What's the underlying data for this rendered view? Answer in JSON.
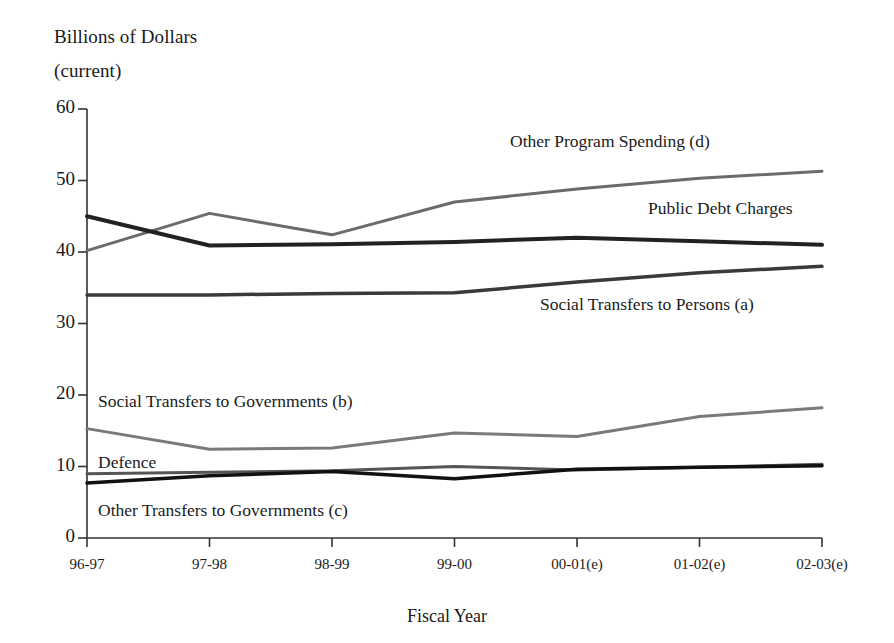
{
  "axis_title": {
    "line1": "Billions of Dollars",
    "line2": "(current)"
  },
  "xaxis_title": "Fiscal Year",
  "chart_data": {
    "type": "line",
    "title": "Billions of Dollars (current)",
    "xlabel": "Fiscal Year",
    "ylabel": "Billions of Dollars (current)",
    "categories": [
      "96-97",
      "97-98",
      "98-99",
      "99-00",
      "00-01(e)",
      "01-02(e)",
      "02-03(e)"
    ],
    "ylim": [
      0,
      60
    ],
    "yticks": [
      0,
      10,
      20,
      30,
      40,
      50,
      60
    ],
    "grid": false,
    "legend": "inline-labels",
    "series": [
      {
        "name": "Other Program Spending (d)",
        "color": "#6b6b6b",
        "width": 3,
        "values": [
          40.2,
          45.4,
          42.4,
          47.0,
          48.8,
          50.3,
          51.3
        ],
        "label_x": 510,
        "label_y": 131
      },
      {
        "name": "Public Debt Charges",
        "color": "#222222",
        "width": 4,
        "values": [
          45.0,
          40.9,
          41.1,
          41.4,
          42.0,
          41.5,
          41.0
        ],
        "label_x": 648,
        "label_y": 198
      },
      {
        "name": "Social Transfers to Persons (a)",
        "color": "#3a3a3a",
        "width": 3.5,
        "values": [
          34.0,
          34.0,
          34.2,
          34.3,
          35.8,
          37.1,
          38.0
        ],
        "label_x": 540,
        "label_y": 294
      },
      {
        "name": "Social Transfers to Governments (b)",
        "color": "#7a7a7a",
        "width": 3,
        "values": [
          15.3,
          12.4,
          12.6,
          14.7,
          14.2,
          17.0,
          18.2
        ],
        "label_x": 98,
        "label_y": 391
      },
      {
        "name": "Defence",
        "color": "#555555",
        "width": 3,
        "values": [
          9.0,
          9.2,
          9.4,
          10.0,
          9.5,
          9.9,
          10.3
        ],
        "label_x": 98,
        "label_y": 452
      },
      {
        "name": "Other Transfers to Governments (c)",
        "color": "#111111",
        "width": 3.5,
        "values": [
          7.7,
          8.7,
          9.3,
          8.3,
          9.6,
          9.9,
          10.1
        ],
        "label_x": 98,
        "label_y": 500
      }
    ]
  },
  "geometry": {
    "x0": 87,
    "x_step": 122.5,
    "y0": 538,
    "y_per_unit": 7.15
  }
}
